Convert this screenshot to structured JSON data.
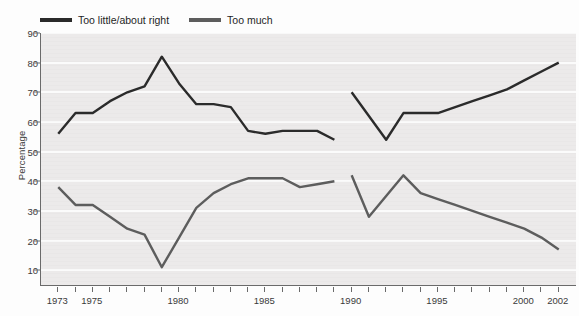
{
  "chart_data": {
    "type": "line",
    "title": "",
    "xlabel": "",
    "ylabel": "Percentage",
    "xlim": [
      1972,
      2003
    ],
    "ylim": [
      5,
      90
    ],
    "yticks": [
      10,
      20,
      30,
      40,
      50,
      60,
      70,
      80,
      90
    ],
    "xticks": [
      1973,
      1974,
      1975,
      1976,
      1977,
      1978,
      1979,
      1980,
      1981,
      1982,
      1983,
      1984,
      1985,
      1986,
      1987,
      1988,
      1989,
      1990,
      1991,
      1992,
      1993,
      1994,
      1995,
      1996,
      1997,
      1998,
      1999,
      2000,
      2001,
      2002
    ],
    "xtick_labels": [
      {
        "year": 1973,
        "label": "1973"
      },
      {
        "year": 1975,
        "label": "1975"
      },
      {
        "year": 1980,
        "label": "1980"
      },
      {
        "year": 1985,
        "label": "1985"
      },
      {
        "year": 1990,
        "label": "1990"
      },
      {
        "year": 1995,
        "label": "1995"
      },
      {
        "year": 2000,
        "label": "2000"
      },
      {
        "year": 2002,
        "label": "2002"
      }
    ],
    "grid": "horizontal",
    "legend_position": "top-left",
    "series": [
      {
        "name": "Too little/about right",
        "color": "#2b2b2b",
        "segments": [
          {
            "x": [
              1973,
              1974,
              1975,
              1976,
              1977,
              1978,
              1979,
              1980,
              1981,
              1982,
              1983,
              1984,
              1985,
              1986,
              1987,
              1988,
              1989
            ],
            "y": [
              56,
              63,
              63,
              67,
              70,
              72,
              82,
              73,
              66,
              66,
              65,
              57,
              56,
              57,
              57,
              57,
              54
            ]
          },
          {
            "x": [
              1990,
              1991,
              1992,
              1993,
              1994,
              1995,
              1996,
              1997,
              1998,
              1999,
              2000,
              2001,
              2002
            ],
            "y": [
              70,
              62,
              54,
              63,
              63,
              63,
              65,
              67,
              69,
              71,
              74,
              77,
              80
            ]
          }
        ]
      },
      {
        "name": "Too much",
        "color": "#5d5d5d",
        "segments": [
          {
            "x": [
              1973,
              1974,
              1975,
              1976,
              1977,
              1978,
              1979,
              1980,
              1981,
              1982,
              1983,
              1984,
              1985,
              1986,
              1987,
              1988,
              1989
            ],
            "y": [
              38,
              32,
              32,
              28,
              24,
              22,
              11,
              21,
              31,
              36,
              39,
              41,
              41,
              41,
              38,
              39,
              40
            ]
          },
          {
            "x": [
              1990,
              1991,
              1992,
              1993,
              1994,
              1995,
              1996,
              1997,
              1998,
              1999,
              2000,
              2001,
              2002
            ],
            "y": [
              42,
              28,
              35,
              42,
              36,
              34,
              32,
              30,
              28,
              26,
              24,
              21,
              17
            ]
          }
        ]
      }
    ]
  },
  "legend": {
    "entries": [
      {
        "label": "Too little/about right",
        "color": "#2b2b2b"
      },
      {
        "label": "Too much",
        "color": "#5d5d5d"
      }
    ]
  },
  "axes": {
    "y_title": "Percentage"
  }
}
